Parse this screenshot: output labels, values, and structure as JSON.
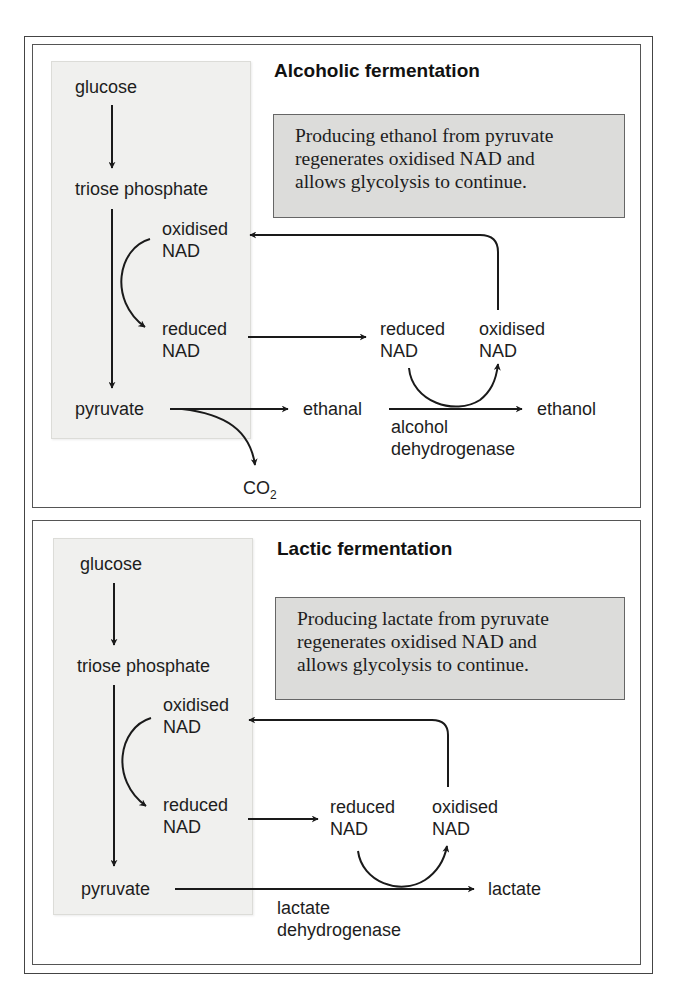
{
  "figure": {
    "panels": [
      {
        "title": "Alcoholic fermentation",
        "caption_lines": [
          "Producing ethanol from pyruvate",
          "regenerates oxidised NAD and",
          "allows glycolysis to continue."
        ],
        "glycolysis": {
          "glucose": "glucose",
          "triose_phosphate": "triose phosphate",
          "pyruvate": "pyruvate",
          "oxidised_nad": [
            "oxidised",
            "NAD"
          ],
          "reduced_nad": [
            "reduced",
            "NAD"
          ]
        },
        "regeneration": {
          "reduced_nad": [
            "reduced",
            "NAD"
          ],
          "oxidised_nad": [
            "oxidised",
            "NAD"
          ]
        },
        "intermediate": "ethanal",
        "byproduct": "CO",
        "byproduct_sub": "2",
        "product": "ethanol",
        "enzyme_lines": [
          "alcohol",
          "dehydrogenase"
        ]
      },
      {
        "title": "Lactic fermentation",
        "caption_lines": [
          "Producing lactate from pyruvate",
          "regenerates oxidised NAD and",
          "allows glycolysis to continue."
        ],
        "glycolysis": {
          "glucose": "glucose",
          "triose_phosphate": "triose phosphate",
          "pyruvate": "pyruvate",
          "oxidised_nad": [
            "oxidised",
            "NAD"
          ],
          "reduced_nad": [
            "reduced",
            "NAD"
          ]
        },
        "regeneration": {
          "reduced_nad": [
            "reduced",
            "NAD"
          ],
          "oxidised_nad": [
            "oxidised",
            "NAD"
          ]
        },
        "product": "lactate",
        "enzyme_lines": [
          "lactate",
          "dehydrogenase"
        ]
      }
    ],
    "colors": {
      "shade": "#f0f0ee",
      "caption_bg": "#dcdcda",
      "line": "#1a1a1a"
    }
  }
}
